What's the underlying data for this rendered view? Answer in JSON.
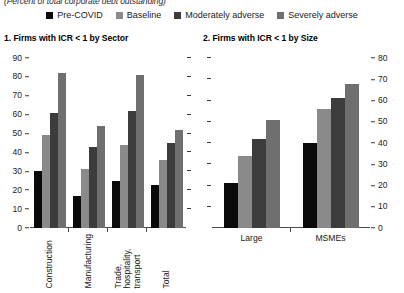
{
  "units_note": "(Percent of total corporate debt outstanding)",
  "legend": {
    "items": [
      {
        "label": "Pre-COVID",
        "color": "#0a0a0a",
        "icon": "square-swatch"
      },
      {
        "label": "Baseline",
        "color": "#8a8a8a",
        "icon": "square-swatch"
      },
      {
        "label": "Moderately adverse",
        "color": "#3c3c3c",
        "icon": "square-swatch"
      },
      {
        "label": "Severely adverse",
        "color": "#6f6f6f",
        "icon": "square-swatch"
      }
    ]
  },
  "panels": [
    {
      "title": "1. Firms with ICR < 1 by Sector"
    },
    {
      "title": "2. Firms with ICR < 1 by Size"
    }
  ],
  "chart_data": [
    {
      "type": "bar",
      "title": "1. Firms with ICR < 1 by Sector",
      "subtitle": "(Percent of total corporate debt outstanding)",
      "xlabel": "",
      "ylabel": "",
      "ylim": [
        0,
        90
      ],
      "yticks": [
        0,
        10,
        20,
        30,
        40,
        50,
        60,
        70,
        80,
        90
      ],
      "ytick_labels": [
        "0",
        "10",
        "20",
        "30",
        "40",
        "50",
        "60",
        "70",
        "80",
        "90"
      ],
      "axis_position": "left",
      "grid": false,
      "legend_position": "top-center",
      "categories": [
        "Construction",
        "Manufacturing",
        "Trade,\nhospitality,\ntransport",
        "Total"
      ],
      "series": [
        {
          "name": "Pre-COVID",
          "color": "#0a0a0a",
          "values": [
            30,
            17,
            25,
            23
          ]
        },
        {
          "name": "Baseline",
          "color": "#8a8a8a",
          "values": [
            49,
            31,
            44,
            36
          ]
        },
        {
          "name": "Moderately adverse",
          "color": "#3c3c3c",
          "values": [
            61,
            43,
            62,
            45
          ]
        },
        {
          "name": "Severely adverse",
          "color": "#6f6f6f",
          "values": [
            82,
            54,
            81,
            52
          ]
        }
      ]
    },
    {
      "type": "bar",
      "title": "2. Firms with ICR < 1 by Size",
      "subtitle": "(Percent of total corporate debt outstanding)",
      "xlabel": "",
      "ylabel": "",
      "ylim": [
        0,
        80
      ],
      "yticks": [
        0,
        10,
        20,
        30,
        40,
        50,
        60,
        70,
        80
      ],
      "ytick_labels": [
        "0",
        "10",
        "20",
        "30",
        "40",
        "50",
        "60",
        "70",
        "80"
      ],
      "axis_position": "right",
      "grid": false,
      "legend_position": "top-center",
      "categories": [
        "Large",
        "MSMEs"
      ],
      "series": [
        {
          "name": "Pre-COVID",
          "color": "#0a0a0a",
          "values": [
            21,
            40
          ]
        },
        {
          "name": "Baseline",
          "color": "#8a8a8a",
          "values": [
            34,
            56
          ]
        },
        {
          "name": "Moderately adverse",
          "color": "#3c3c3c",
          "values": [
            42,
            61
          ]
        },
        {
          "name": "Severely adverse",
          "color": "#6f6f6f",
          "values": [
            51,
            68
          ]
        }
      ]
    }
  ]
}
